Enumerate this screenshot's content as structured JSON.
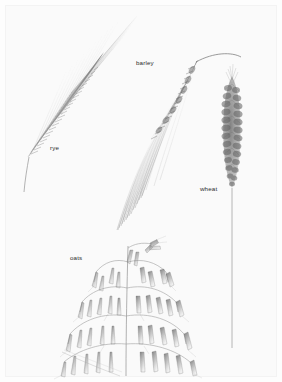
{
  "plate": {
    "kind": "botanical-pencil-illustration",
    "subject": "cereal grain spikes",
    "paper_color": "#fafafa",
    "ink_color": "#6b6b6b",
    "width": 282,
    "height": 382
  },
  "labels": {
    "rye": "rye",
    "barley": "barley",
    "wheat": "wheat",
    "oats": "oats"
  },
  "specimens": [
    {
      "name": "rye",
      "label": "rye",
      "label_x": 50,
      "label_y": 145,
      "orientation": "diagonal, tilted up-right",
      "spike_top_x": 118,
      "spike_top_y": 18,
      "spike_base_x": 30,
      "spike_base_y": 155,
      "stem_end_x": 24,
      "stem_end_y": 192,
      "awn_count": 46,
      "awn_length": 62,
      "description": "narrow nodding spike with very long straight awns fanning up and to the right"
    },
    {
      "name": "barley",
      "label": "barley",
      "label_x": 136,
      "label_y": 60,
      "orientation": "arched, nodding to the lower-left",
      "spike_top_x": 196,
      "spike_top_y": 60,
      "spike_base_x": 152,
      "spike_base_y": 135,
      "stem_end_x": 240,
      "stem_end_y": 56,
      "awn_count": 34,
      "awn_length": 110,
      "description": "arched culm bending over; dense two-ranked spike with long awns sweeping down-left"
    },
    {
      "name": "wheat",
      "label": "wheat",
      "label_x": 200,
      "label_y": 186,
      "orientation": "upright",
      "spike_top_x": 232,
      "spike_top_y": 74,
      "spike_base_x": 232,
      "spike_base_y": 186,
      "stem_end_x": 232,
      "stem_end_y": 348,
      "spikelet_rows": 15,
      "description": "short dense upright spike of overlapping spikelets on a long straight stem"
    },
    {
      "name": "oats",
      "label": "oats",
      "label_x": 70,
      "label_y": 255,
      "orientation": "upright panicle",
      "panicle_top_x": 128,
      "panicle_top_y": 242,
      "panicle_base_x": 126,
      "panicle_base_y": 372,
      "whorl_count": 5,
      "spikelet_count": 34,
      "description": "open branching panicle with pendulous pointed spikelets on spreading arms"
    }
  ]
}
